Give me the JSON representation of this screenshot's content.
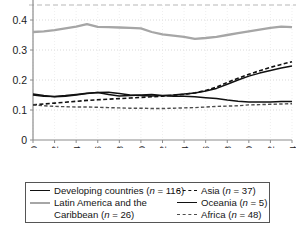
{
  "chart_data": {
    "type": "line",
    "title": "",
    "xlabel": "",
    "ylabel": "",
    "xlim": [
      1990,
      2014
    ],
    "ylim": [
      0,
      0.45
    ],
    "grid": true,
    "legend_position": "below-axis",
    "x": [
      1990,
      1991,
      1992,
      1993,
      1994,
      1995,
      1996,
      1997,
      1998,
      1999,
      2000,
      2001,
      2002,
      2003,
      2004,
      2005,
      2006,
      2007,
      2008,
      2009,
      2010,
      2011,
      2012,
      2013,
      2014
    ],
    "y_ticks": [
      0,
      0.1,
      0.2,
      0.3,
      0.4
    ],
    "y_tick_labels": [
      "0",
      "0.1",
      "0.2",
      "0.3",
      "0.4"
    ],
    "x_ticks": [
      1990,
      1992,
      1994,
      1996,
      1998,
      2000,
      2002,
      2004,
      2006,
      2008,
      2010,
      2012,
      2014
    ],
    "x_tick_labels": [
      "1990",
      "1992",
      "1994",
      "1996",
      "1998",
      "2000",
      "2002",
      "2004",
      "2006",
      "2008",
      "2010",
      "2012",
      "2014"
    ],
    "series": [
      {
        "name": "Developing countries",
        "n": 116,
        "label": "Developing countries (n = 116)",
        "style": "solid",
        "color": "#111111",
        "width": 1.5,
        "values": [
          0.15,
          0.146,
          0.145,
          0.148,
          0.152,
          0.156,
          0.158,
          0.159,
          0.155,
          0.15,
          0.148,
          0.147,
          0.148,
          0.15,
          0.153,
          0.157,
          0.163,
          0.172,
          0.186,
          0.2,
          0.213,
          0.223,
          0.232,
          0.24,
          0.247
        ]
      },
      {
        "name": "Latin America and the Caribbean",
        "n": 26,
        "label": "Latin America and the Caribbean (n = 26)",
        "style": "solid",
        "color": "#a6a6a6",
        "width": 2.3,
        "values": [
          0.36,
          0.362,
          0.366,
          0.372,
          0.378,
          0.386,
          0.377,
          0.376,
          0.375,
          0.374,
          0.372,
          0.36,
          0.352,
          0.348,
          0.344,
          0.337,
          0.34,
          0.344,
          0.35,
          0.356,
          0.362,
          0.368,
          0.374,
          0.378,
          0.376
        ]
      },
      {
        "name": "Asia",
        "n": 37,
        "label": "Asia (n = 37)",
        "style": "dashed",
        "color": "#111111",
        "width": 1.6,
        "values": [
          0.117,
          0.12,
          0.123,
          0.126,
          0.129,
          0.132,
          0.134,
          0.136,
          0.138,
          0.14,
          0.142,
          0.144,
          0.146,
          0.149,
          0.152,
          0.157,
          0.165,
          0.176,
          0.192,
          0.206,
          0.219,
          0.231,
          0.242,
          0.252,
          0.261
        ]
      },
      {
        "name": "Oceania",
        "n": 5,
        "label": "Oceania (n = 5)",
        "style": "solid",
        "color": "#111111",
        "width": 1.5,
        "values": [
          0.153,
          0.148,
          0.144,
          0.146,
          0.15,
          0.155,
          0.158,
          0.152,
          0.147,
          0.148,
          0.15,
          0.152,
          0.148,
          0.146,
          0.146,
          0.144,
          0.141,
          0.138,
          0.133,
          0.129,
          0.127,
          0.127,
          0.127,
          0.128,
          0.128
        ]
      },
      {
        "name": "Africa",
        "n": 48,
        "label": "Africa (n = 48)",
        "style": "dashed",
        "color": "#4d4d4d",
        "width": 1.4,
        "values": [
          0.117,
          0.114,
          0.112,
          0.111,
          0.11,
          0.11,
          0.109,
          0.108,
          0.107,
          0.106,
          0.106,
          0.105,
          0.105,
          0.106,
          0.107,
          0.108,
          0.11,
          0.112,
          0.113,
          0.114,
          0.117,
          0.118,
          0.119,
          0.12,
          0.121
        ]
      }
    ],
    "reference_line": {
      "name": "upper-dashed-guide",
      "value": 0.45,
      "style": "dashed",
      "color": "#d0d0d0"
    }
  },
  "legend": {
    "columns": [
      {
        "entries": [
          {
            "swatch": "solid-black",
            "text": "Developing countries (n = 116)",
            "indent": false
          },
          {
            "swatch": "solid-gray",
            "text": "Latin America and the",
            "indent": false
          },
          {
            "swatch": "none",
            "text": "Caribbean (n = 26)",
            "indent": true
          }
        ]
      },
      {
        "entries": [
          {
            "swatch": "dash-black",
            "text": "Asia (n = 37)",
            "indent": false
          },
          {
            "swatch": "solid-black",
            "text": "Oceania (n = 5)",
            "indent": false
          },
          {
            "swatch": "dash-gray",
            "text": "Africa (n = 48)",
            "indent": false
          }
        ]
      }
    ]
  }
}
